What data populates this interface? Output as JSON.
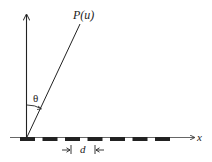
{
  "diagram": {
    "type": "diffraction-grating-geometry",
    "labels": {
      "point": "P(u)",
      "angle": "θ",
      "x_axis": "x",
      "spacing": "d"
    },
    "colors": {
      "stroke": "#222222",
      "slit": "#222222",
      "background": "#ffffff"
    },
    "slit_count": 7
  }
}
